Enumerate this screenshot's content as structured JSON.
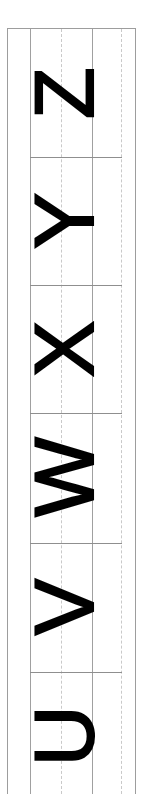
{
  "worksheet": {
    "title": "Uppercase letter tracing strip",
    "orientation": "rotated-90-ccw",
    "background_color": "#ffffff",
    "ink_color": "#000000",
    "frame_color": "#9d9d9d",
    "guide_solid_color": "#a0a0a0",
    "guide_dashed_color": "#c9c9c9",
    "divider_color": "#8f8f8f",
    "guides": [
      {
        "name": "top-line",
        "style": "solid"
      },
      {
        "name": "mid-line",
        "style": "dashed"
      },
      {
        "name": "base-line",
        "style": "solid"
      },
      {
        "name": "descender-line",
        "style": "dashed"
      }
    ],
    "rows": [
      {
        "index": 1,
        "letter": "Z",
        "case": "uppercase"
      },
      {
        "index": 2,
        "letter": "Y",
        "case": "uppercase"
      },
      {
        "index": 3,
        "letter": "X",
        "case": "uppercase"
      },
      {
        "index": 4,
        "letter": "W",
        "case": "uppercase"
      },
      {
        "index": 5,
        "letter": "V",
        "case": "uppercase"
      },
      {
        "index": 6,
        "letter": "U",
        "case": "uppercase"
      }
    ]
  }
}
